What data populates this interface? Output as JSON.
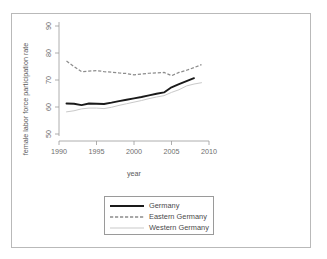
{
  "figure": {
    "border_color": "#b9b9b9",
    "background": "#ffffff"
  },
  "axis": {
    "xlabel": "year",
    "ylabel": "female labor force participation rate",
    "x_ticks": [
      "1990",
      "1995",
      "2000",
      "2005",
      "2010"
    ],
    "y_ticks": [
      "50",
      "60",
      "70",
      "80",
      "90"
    ]
  },
  "legend": {
    "items": [
      {
        "label": "Germany",
        "style": "solid-thick-black",
        "color": "#1a1a1a"
      },
      {
        "label": "Eastern Germany",
        "style": "dashed-gray",
        "color": "#8c8c8c"
      },
      {
        "label": "Western Germany",
        "style": "solid-thin-light-gray",
        "color": "#c9c9c9"
      }
    ]
  },
  "chart_data": {
    "type": "line",
    "title": "",
    "xlabel": "year",
    "ylabel": "female labor force participation rate",
    "xlim": [
      1990,
      2010
    ],
    "ylim": [
      48,
      92
    ],
    "grid": false,
    "legend_position": "below-plot",
    "xticks": [
      1990,
      1995,
      2000,
      2005,
      2010
    ],
    "yticks": [
      50,
      60,
      70,
      80,
      90
    ],
    "x": [
      1991,
      1992,
      1993,
      1994,
      1995,
      1996,
      1997,
      1998,
      1999,
      2000,
      2001,
      2002,
      2003,
      2004,
      2005,
      2006,
      2007,
      2008,
      2009
    ],
    "series": [
      {
        "name": "Germany",
        "color": "#1a1a1a",
        "values": [
          61.3,
          61.2,
          60.7,
          61.3,
          61.2,
          61.1,
          61.6,
          62.2,
          62.7,
          63.2,
          63.7,
          64.3,
          64.9,
          65.4,
          67.3,
          68.5,
          69.6,
          70.7,
          null
        ]
      },
      {
        "name": "Eastern Germany",
        "color": "#8c8c8c",
        "values": [
          77.0,
          75.0,
          73.1,
          73.3,
          73.5,
          73.1,
          72.9,
          72.6,
          72.4,
          71.9,
          72.2,
          72.5,
          72.6,
          72.8,
          71.6,
          72.8,
          73.6,
          74.6,
          75.7
        ]
      },
      {
        "name": "Western Germany",
        "color": "#c9c9c9",
        "values": [
          58.2,
          58.6,
          59.3,
          59.6,
          59.6,
          59.4,
          59.9,
          60.6,
          61.2,
          61.8,
          62.4,
          63.1,
          63.7,
          64.2,
          65.4,
          66.4,
          67.8,
          68.5,
          69.0
        ]
      }
    ]
  }
}
